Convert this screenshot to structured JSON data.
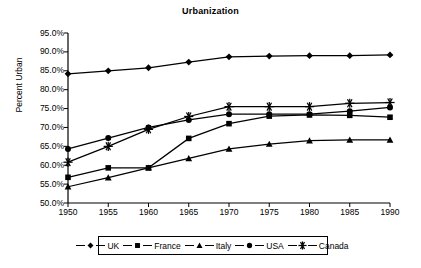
{
  "chart_data": {
    "type": "line",
    "title": "Urbanization",
    "xlabel": "",
    "ylabel": "Percent Urban",
    "x": [
      1950,
      1955,
      1960,
      1965,
      1970,
      1975,
      1980,
      1985,
      1990
    ],
    "categories": [
      "1950",
      "1955",
      "1960",
      "1965",
      "1970",
      "1975",
      "1980",
      "1985",
      "1990"
    ],
    "xlim": [
      1950,
      1990
    ],
    "ylim": [
      50.0,
      95.0
    ],
    "ytick_labels": [
      "50.0%",
      "55.0%",
      "60.0%",
      "65.0%",
      "70.0%",
      "75.0%",
      "80.0%",
      "85.0%",
      "90.0%",
      "95.0%"
    ],
    "ytick_values": [
      50,
      55,
      60,
      65,
      70,
      75,
      80,
      85,
      90,
      95
    ],
    "grid": false,
    "legend_position": "bottom",
    "units": "percent",
    "series": [
      {
        "name": "UK",
        "marker": "diamond",
        "values": [
          84.2,
          85.0,
          85.8,
          87.3,
          88.7,
          88.9,
          89.0,
          89.0,
          89.2
        ]
      },
      {
        "name": "France",
        "marker": "square",
        "values": [
          56.8,
          59.3,
          59.3,
          67.1,
          71.0,
          73.0,
          73.3,
          73.2,
          72.7
        ]
      },
      {
        "name": "Italy",
        "marker": "triangle",
        "values": [
          54.3,
          56.7,
          59.3,
          61.8,
          64.3,
          65.6,
          66.5,
          66.7,
          66.7
        ]
      },
      {
        "name": "USA",
        "marker": "circle",
        "values": [
          64.3,
          67.2,
          70.0,
          72.0,
          73.5,
          73.5,
          73.5,
          74.3,
          75.3
        ]
      },
      {
        "name": "Canada",
        "marker": "asterisk",
        "values": [
          60.8,
          65.0,
          69.5,
          72.9,
          75.5,
          75.5,
          75.5,
          76.4,
          76.6
        ]
      }
    ]
  },
  "colors": {
    "ink": "#000000",
    "background": "#ffffff"
  }
}
